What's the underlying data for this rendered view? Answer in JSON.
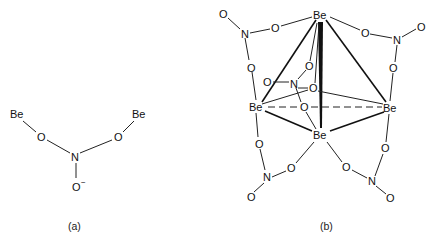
{
  "figure": {
    "panel_a": {
      "caption": "(a)",
      "atoms": {
        "be_left": "Be",
        "be_right": "Be",
        "o_left": "O",
        "o_right": "O",
        "n_center": "N",
        "o_minus": "O",
        "charge": "−"
      }
    },
    "panel_b": {
      "caption": "(b)",
      "atoms": {
        "be_top": "Be",
        "be_left": "Be",
        "be_right": "Be",
        "be_bottom": "Be",
        "tl_o_term": "O",
        "tl_n": "N",
        "tl_o1": "O",
        "tl_o2": "O",
        "tr_o_term": "O",
        "tr_n": "N",
        "tr_o1": "O",
        "tr_o2": "O",
        "bl_o_term": "O",
        "bl_n": "N",
        "bl_o1": "O",
        "bl_o2": "O",
        "br_o_term": "O",
        "br_n": "N",
        "br_o1": "O",
        "br_o2": "O",
        "c_o_term": "O",
        "c_n": "N",
        "c_o1": "O",
        "c_o2": "O",
        "c_o3": "O"
      }
    }
  }
}
